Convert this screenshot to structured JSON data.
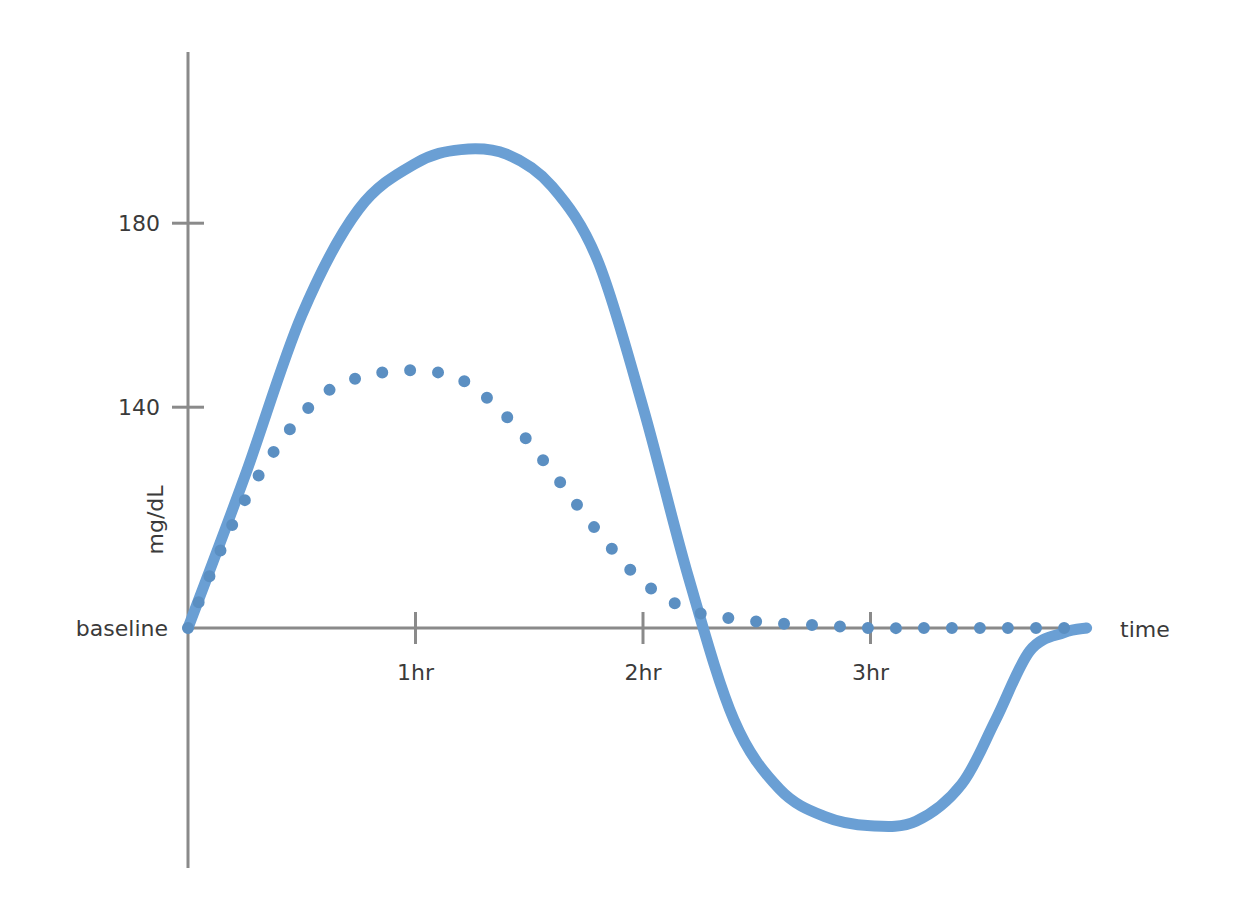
{
  "chart_data": {
    "type": "line",
    "title": "",
    "xlabel": "time",
    "ylabel": "mg/dL",
    "x_ticks": [
      "1hr",
      "2hr",
      "3hr"
    ],
    "y_ticks": [
      {
        "label": "180",
        "value": 180
      },
      {
        "label": "140",
        "value": 140
      },
      {
        "label": "baseline",
        "value": 92
      }
    ],
    "xlim": [
      0,
      3.95
    ],
    "ylim": [
      40,
      220
    ],
    "grid": false,
    "legend": null,
    "colors": {
      "solid": "#6a9fd4",
      "dotted": "#5b8fc2",
      "axis": "#8a8a8a",
      "text": "#3a3a3a"
    },
    "series": [
      {
        "name": "solid",
        "style": "solid",
        "x": [
          0,
          0.25,
          0.5,
          0.75,
          1.0,
          1.2,
          1.4,
          1.6,
          1.8,
          2.0,
          2.2,
          2.4,
          2.6,
          2.8,
          3.0,
          3.2,
          3.4,
          3.55,
          3.7,
          3.85,
          3.95
        ],
        "y": [
          92,
          125,
          160,
          183,
          193,
          196,
          195,
          188,
          172,
          140,
          103,
          72,
          57,
          51,
          49,
          50,
          58,
          72,
          87,
          91,
          92
        ]
      },
      {
        "name": "dotted",
        "style": "dotted",
        "x": [
          0,
          0.2,
          0.4,
          0.6,
          0.8,
          1.0,
          1.2,
          1.4,
          1.6,
          1.8,
          2.0,
          2.2,
          2.4,
          2.6,
          2.8,
          3.0,
          3.2,
          3.4,
          3.6,
          3.8,
          3.95
        ],
        "y": [
          92,
          115,
          132,
          143,
          147,
          148,
          146,
          138,
          126,
          113,
          102,
          96,
          94,
          93,
          92.5,
          92,
          92,
          92,
          92,
          92,
          92
        ]
      }
    ]
  }
}
